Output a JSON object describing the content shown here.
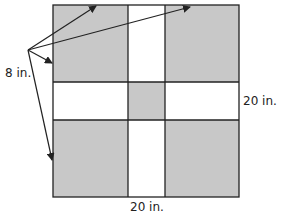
{
  "diagram": {
    "type": "square-with-cross-cutouts",
    "labels": {
      "corner_side": "8 in.",
      "right_side": "20 in.",
      "bottom_side": "20 in."
    },
    "colors": {
      "shaded": "#c8c8c8",
      "unshaded": "#ffffff",
      "stroke": "#222222"
    }
  }
}
